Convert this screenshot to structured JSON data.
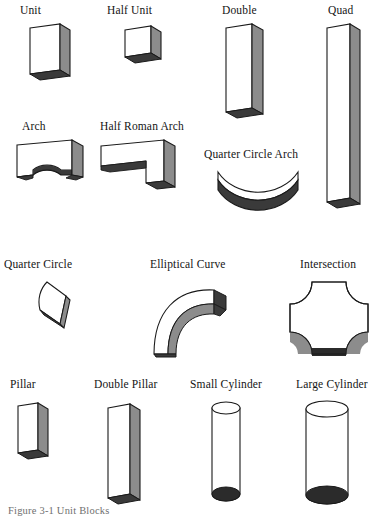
{
  "figure": {
    "caption": "Figure 3-1  Unit Blocks",
    "background_color": "#ffffff",
    "palette": {
      "face_front": "#ffffff",
      "face_side": "#8c8c8c",
      "face_bottom": "#3a3a3a",
      "outline": "#1a1a1a",
      "shadow_mid": "#9a9a9a",
      "label_color": "#141414",
      "caption_color": "#6f6f6f"
    }
  },
  "rows": [
    {
      "row_index": 1,
      "items": [
        {
          "label": "Unit",
          "shape": "rectangular-prism-block"
        },
        {
          "label": "Half Unit",
          "shape": "cube-block"
        },
        {
          "label": "Double",
          "shape": "tall-prism-block"
        },
        {
          "label": "Quad",
          "shape": "very-tall-prism-block"
        }
      ]
    },
    {
      "row_index": 2,
      "items": [
        {
          "label": "Arch",
          "shape": "semicircular-arch-block"
        },
        {
          "label": "Half Roman Arch",
          "shape": "l-shaped-arch-block"
        },
        {
          "label": "Quarter Circle Arch",
          "shape": "curved-crescent-arc-block"
        }
      ]
    },
    {
      "row_index": 3,
      "items": [
        {
          "label": "Quarter Circle",
          "shape": "wedge-quarter-circle-block"
        },
        {
          "label": "Elliptical Curve",
          "shape": "curved-hook-block"
        },
        {
          "label": "Intersection",
          "shape": "cross-intersection-block"
        }
      ]
    },
    {
      "row_index": 4,
      "items": [
        {
          "label": "Pillar",
          "shape": "short-pillar-block"
        },
        {
          "label": "Double Pillar",
          "shape": "tall-pillar-block"
        },
        {
          "label": "Small Cylinder",
          "shape": "narrow-cylinder"
        },
        {
          "label": "Large Cylinder",
          "shape": "wide-cylinder"
        }
      ]
    }
  ]
}
